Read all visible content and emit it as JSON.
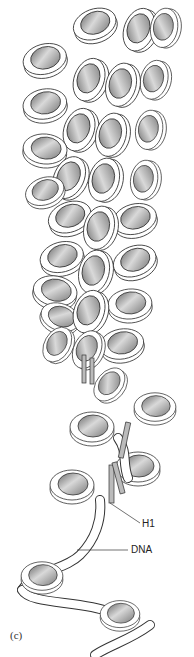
{
  "figure": {
    "panel_label": "(c)",
    "labels": {
      "h1": "H1",
      "dna": "DNA"
    },
    "colors": {
      "background": "#ffffff",
      "outline": "#333333",
      "dna_fill": "#ffffff",
      "histone_dark": "#6e6e6e",
      "histone_light": "#d8d8d8"
    }
  }
}
